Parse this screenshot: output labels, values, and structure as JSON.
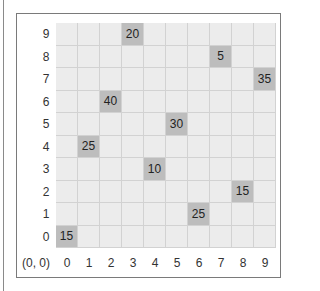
{
  "board": {
    "rows": 10,
    "cols": 10,
    "origin_label": "(0, 0)",
    "x_labels": [
      "0",
      "1",
      "2",
      "3",
      "4",
      "5",
      "6",
      "7",
      "8",
      "9"
    ],
    "y_labels": [
      "0",
      "1",
      "2",
      "3",
      "4",
      "5",
      "6",
      "7",
      "8",
      "9"
    ],
    "cells": [
      {
        "x": 3,
        "y": 9,
        "value": "20"
      },
      {
        "x": 7,
        "y": 8,
        "value": "5"
      },
      {
        "x": 9,
        "y": 7,
        "value": "35"
      },
      {
        "x": 2,
        "y": 6,
        "value": "40"
      },
      {
        "x": 5,
        "y": 5,
        "value": "30"
      },
      {
        "x": 1,
        "y": 4,
        "value": "25"
      },
      {
        "x": 4,
        "y": 3,
        "value": "10"
      },
      {
        "x": 8,
        "y": 2,
        "value": "15"
      },
      {
        "x": 6,
        "y": 1,
        "value": "25"
      },
      {
        "x": 0,
        "y": 0,
        "value": "15"
      }
    ],
    "colors": {
      "empty": "#ececec",
      "filled": "#bdbdbd",
      "grid_line": "#d2d2d2"
    }
  }
}
